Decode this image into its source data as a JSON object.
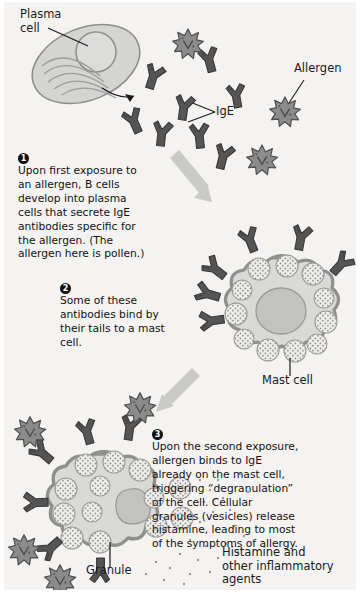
{
  "figure": {
    "background": "#f4f3f1",
    "ink": "#1a1a1a"
  },
  "palette": {
    "antibody": "#5a5a5a",
    "antibody_dark": "#3f3f3f",
    "pollen_fill": "#8a8a8a",
    "pollen_dark": "#6e6e6e",
    "cell_fill": "#d9d9d7",
    "cell_membrane": "#9a9a98",
    "nucleus": "#bdbdbb",
    "granule_fill": "#ebebe9",
    "granule_dot": "#8d8d8b",
    "arrow": "#c9c9c7",
    "outline": "#4a4a4a"
  },
  "labels": {
    "plasma_cell": "Plasma\ncell",
    "allergen": "Allergen",
    "ige": "IgE",
    "mast_cell": "Mast cell",
    "granule": "Granule",
    "histamine": "Histamine and\nother inflammatory\nagents"
  },
  "steps": [
    {
      "number": "1",
      "text": "Upon first exposure to an allergen, B cells develop into plasma cells that secrete IgE antibodies specific for the allergen. (The allergen here is pollen.)"
    },
    {
      "number": "2",
      "text": "Some of these antibodies bind by their tails to a mast cell."
    },
    {
      "number": "3",
      "text": "Upon the second exposure, allergen binds to IgE already on the mast cell, triggering “degranulation” of the cell. Cellular granules (vesicles) release histamine, leading to most of the symptoms of allergy."
    }
  ]
}
